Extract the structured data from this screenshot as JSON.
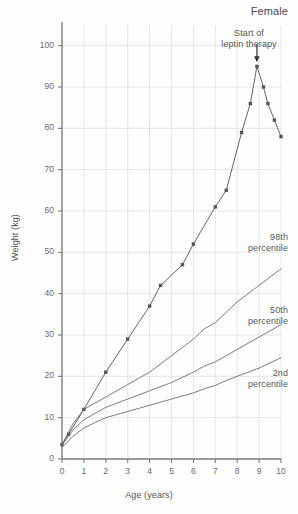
{
  "figure": {
    "sex_title": "Female",
    "background": "#fdfdfd"
  },
  "axes": {
    "ylabel": "Weight (kg)",
    "xlabel": "Age (years)",
    "y_ticks": [
      0,
      10,
      20,
      30,
      40,
      50,
      60,
      70,
      80,
      90,
      100
    ],
    "x_ticks": [
      0,
      1,
      2,
      3,
      4,
      5,
      6,
      7,
      8,
      9,
      10
    ],
    "axis_color": "#7a7a7a",
    "grid_color": "#dcdcdc"
  },
  "annotations": {
    "leptin_line1": "Start of",
    "leptin_line2": "leptin therapy",
    "percentile_98_line1": "98th",
    "percentile_98_line2": "percentile",
    "percentile_50_line1": "50th",
    "percentile_50_line2": "percentile",
    "percentile_2_line1": "2nd",
    "percentile_2_line2": "percentile"
  },
  "chart_data": {
    "type": "line",
    "title": "Female",
    "xlabel": "Age (years)",
    "ylabel": "Weight (kg)",
    "xlim": [
      0,
      10
    ],
    "ylim": [
      0,
      105
    ],
    "grid": true,
    "legend_position": "inline-labels",
    "xticks": [
      0,
      1,
      2,
      3,
      4,
      5,
      6,
      7,
      8,
      9,
      10
    ],
    "yticks": [
      0,
      10,
      20,
      30,
      40,
      50,
      60,
      70,
      80,
      90,
      100
    ],
    "series": [
      {
        "name": "Patient weight",
        "marker": "filled-square",
        "color": "#555555",
        "points": [
          {
            "x": 0.0,
            "y": 3.5
          },
          {
            "x": 0.3,
            "y": 6.0
          },
          {
            "x": 1.0,
            "y": 12.0
          },
          {
            "x": 2.0,
            "y": 21.0
          },
          {
            "x": 3.0,
            "y": 29.0
          },
          {
            "x": 4.0,
            "y": 37.0
          },
          {
            "x": 4.5,
            "y": 42.0
          },
          {
            "x": 5.5,
            "y": 47.0
          },
          {
            "x": 6.0,
            "y": 52.0
          },
          {
            "x": 7.0,
            "y": 61.0
          },
          {
            "x": 7.5,
            "y": 65.0
          },
          {
            "x": 8.2,
            "y": 79.0
          },
          {
            "x": 8.6,
            "y": 86.0
          },
          {
            "x": 8.9,
            "y": 95.0
          },
          {
            "x": 9.2,
            "y": 90.0
          },
          {
            "x": 9.4,
            "y": 86.0
          },
          {
            "x": 9.7,
            "y": 82.0
          },
          {
            "x": 10.0,
            "y": 78.0
          }
        ]
      },
      {
        "name": "98th percentile",
        "marker": "none",
        "color": "#6e6e6e",
        "points": [
          {
            "x": 0.0,
            "y": 3.5
          },
          {
            "x": 0.5,
            "y": 8.5
          },
          {
            "x": 1.0,
            "y": 12.0
          },
          {
            "x": 1.5,
            "y": 13.5
          },
          {
            "x": 2.0,
            "y": 15.0
          },
          {
            "x": 3.0,
            "y": 18.0
          },
          {
            "x": 4.0,
            "y": 21.0
          },
          {
            "x": 5.0,
            "y": 25.0
          },
          {
            "x": 6.0,
            "y": 29.0
          },
          {
            "x": 6.5,
            "y": 31.5
          },
          {
            "x": 7.0,
            "y": 33.0
          },
          {
            "x": 7.5,
            "y": 35.5
          },
          {
            "x": 8.0,
            "y": 38.0
          },
          {
            "x": 9.0,
            "y": 42.0
          },
          {
            "x": 10.0,
            "y": 46.0
          }
        ]
      },
      {
        "name": "50th percentile",
        "marker": "none",
        "color": "#6e6e6e",
        "points": [
          {
            "x": 0.0,
            "y": 3.3
          },
          {
            "x": 0.5,
            "y": 7.0
          },
          {
            "x": 1.0,
            "y": 9.5
          },
          {
            "x": 1.5,
            "y": 11.0
          },
          {
            "x": 2.0,
            "y": 12.5
          },
          {
            "x": 3.0,
            "y": 14.5
          },
          {
            "x": 4.0,
            "y": 16.5
          },
          {
            "x": 5.0,
            "y": 18.5
          },
          {
            "x": 6.0,
            "y": 21.0
          },
          {
            "x": 6.5,
            "y": 22.5
          },
          {
            "x": 7.0,
            "y": 23.5
          },
          {
            "x": 7.5,
            "y": 25.0
          },
          {
            "x": 8.0,
            "y": 26.5
          },
          {
            "x": 9.0,
            "y": 29.5
          },
          {
            "x": 10.0,
            "y": 32.5
          }
        ]
      },
      {
        "name": "2nd percentile",
        "marker": "none",
        "color": "#6e6e6e",
        "points": [
          {
            "x": 0.0,
            "y": 2.8
          },
          {
            "x": 0.5,
            "y": 5.5
          },
          {
            "x": 1.0,
            "y": 7.5
          },
          {
            "x": 1.5,
            "y": 8.8
          },
          {
            "x": 2.0,
            "y": 10.0
          },
          {
            "x": 3.0,
            "y": 11.5
          },
          {
            "x": 4.0,
            "y": 13.0
          },
          {
            "x": 5.0,
            "y": 14.5
          },
          {
            "x": 6.0,
            "y": 16.0
          },
          {
            "x": 6.5,
            "y": 17.0
          },
          {
            "x": 7.0,
            "y": 17.8
          },
          {
            "x": 7.5,
            "y": 19.0
          },
          {
            "x": 8.0,
            "y": 20.0
          },
          {
            "x": 9.0,
            "y": 22.0
          },
          {
            "x": 10.0,
            "y": 24.5
          }
        ]
      }
    ],
    "annotations": [
      {
        "text": "Start of leptin therapy",
        "x": 8.9,
        "y": 95.0,
        "arrow": "down"
      }
    ]
  }
}
